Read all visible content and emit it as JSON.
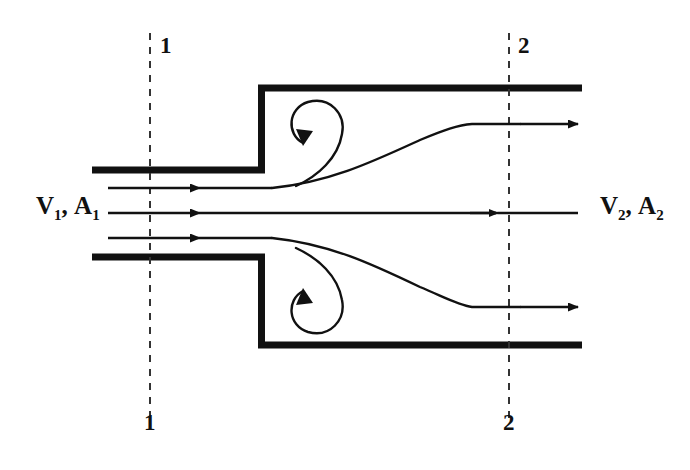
{
  "figure": {
    "background_color": "#ffffff",
    "line_color": "#111111",
    "width": 690,
    "height": 470
  },
  "labels": {
    "inlet": {
      "velocity_symbol": "V",
      "velocity_subscript": "1",
      "separator": ",",
      "area_symbol": "A",
      "area_subscript": "1",
      "full_text": "V1, A1"
    },
    "outlet": {
      "velocity_symbol": "V",
      "velocity_subscript": "2",
      "separator": ",",
      "area_symbol": "A",
      "area_subscript": "2",
      "full_text": "V2, A2"
    },
    "section_markers": {
      "inlet_top": "1",
      "inlet_bottom": "1",
      "outlet_top": "2",
      "outlet_bottom": "2"
    }
  },
  "geometry": {
    "inlet_pipe": {
      "left_x": 92,
      "upper_wall_y": 170,
      "lower_wall_y": 257,
      "step_x": 258,
      "wall_thickness": 7
    },
    "outlet_pipe": {
      "right_x": 582,
      "upper_wall_y": 88,
      "lower_wall_y": 345,
      "wall_thickness": 7
    },
    "section_lines": {
      "section_1_x": 150,
      "section_2_x": 509,
      "top_y": 33,
      "bottom_y": 420,
      "style": "dashed"
    },
    "centerline_y": 213
  },
  "streamlines": {
    "inlet": [
      {
        "name": "upper-inlet-streamline",
        "y": 188,
        "x_start": 108,
        "x_arrow": 200
      },
      {
        "name": "center-inlet-streamline",
        "y": 213,
        "x_start": 108,
        "x_arrow": 200
      },
      {
        "name": "lower-inlet-streamline",
        "y": 238,
        "x_start": 108,
        "x_arrow": 200
      }
    ],
    "outlet": [
      {
        "name": "upper-outlet-streamline",
        "y": 124,
        "x_end": 578
      },
      {
        "name": "center-outlet-streamline",
        "y": 213,
        "x_arrow": 496,
        "x_end": 578
      },
      {
        "name": "lower-outlet-streamline",
        "y": 307,
        "x_end": 578
      }
    ]
  },
  "vortices": [
    {
      "name": "upper-recirculation-vortex",
      "position": "upper-step-corner",
      "rotation": "clockwise",
      "center_x": 310,
      "center_y": 130
    },
    {
      "name": "lower-recirculation-vortex",
      "position": "lower-step-corner",
      "rotation": "counter-clockwise",
      "center_x": 310,
      "center_y": 303
    }
  ]
}
